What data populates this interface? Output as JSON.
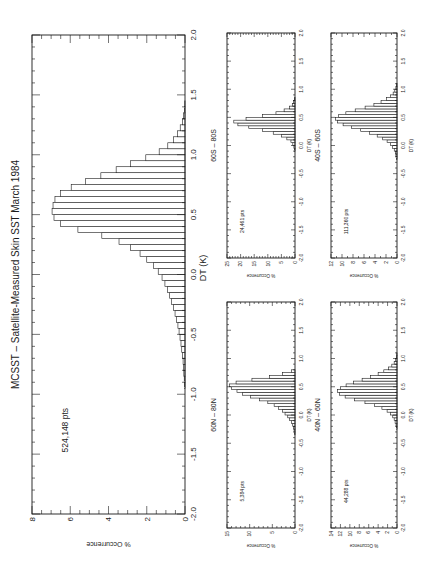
{
  "figure": {
    "title": "MCSST – Satellite-Measured Skin SST   March 1984",
    "orientation": "rotated 90 degrees clockwise"
  },
  "chart_data": [
    {
      "id": "main",
      "type": "bar",
      "title": "MCSST – Satellite-Measured Skin SST   March 1984",
      "annotation": "524,148 pts",
      "xlabel": "DT (K)",
      "ylabel": "% Occurrence",
      "xlim": [
        -2.0,
        2.0
      ],
      "ylim": [
        0,
        8
      ],
      "xticks": [
        "-2.0",
        "-1.5",
        "-1.0",
        "-0.5",
        "0.0",
        "0.5",
        "1.0",
        "1.5",
        "2.0"
      ],
      "yticks": [
        "0",
        "2",
        "4",
        "6",
        "8"
      ],
      "bin_width": 0.05,
      "x": [
        -0.95,
        -0.9,
        -0.85,
        -0.8,
        -0.75,
        -0.7,
        -0.65,
        -0.6,
        -0.55,
        -0.5,
        -0.45,
        -0.4,
        -0.35,
        -0.3,
        -0.25,
        -0.2,
        -0.15,
        -0.1,
        -0.05,
        0.0,
        0.05,
        0.1,
        0.15,
        0.2,
        0.25,
        0.3,
        0.35,
        0.4,
        0.45,
        0.5,
        0.55,
        0.6,
        0.65,
        0.7,
        0.75,
        0.8,
        0.85,
        0.9,
        0.95,
        1.0,
        1.05,
        1.1,
        1.15,
        1.2,
        1.25,
        1.3,
        1.35,
        1.4
      ],
      "values": [
        0.02,
        0.04,
        0.06,
        0.08,
        0.1,
        0.13,
        0.17,
        0.21,
        0.26,
        0.31,
        0.37,
        0.44,
        0.52,
        0.6,
        0.7,
        0.8,
        0.92,
        1.05,
        1.2,
        1.4,
        1.65,
        2.0,
        2.35,
        2.85,
        3.45,
        4.35,
        5.6,
        6.5,
        6.85,
        6.95,
        6.9,
        6.8,
        6.5,
        5.95,
        5.2,
        4.4,
        3.6,
        2.85,
        2.05,
        1.35,
        0.9,
        0.6,
        0.4,
        0.25,
        0.14,
        0.07,
        0.03,
        0.01
      ]
    },
    {
      "id": "60S-80S",
      "type": "bar",
      "title": "60S – 80S",
      "annotation": "24,461 pts",
      "xlabel": "DT (K)",
      "ylabel": "% Occurrence",
      "xlim": [
        -2.0,
        2.0
      ],
      "ylim": [
        0,
        25
      ],
      "xticks": [
        "-2.0",
        "-1.5",
        "-1.0",
        "-0.5",
        "0.0",
        "0.5",
        "1.0",
        "1.5",
        "2.0"
      ],
      "yticks": [
        "0",
        "5",
        "10",
        "15",
        "20",
        "25"
      ],
      "bin_width": 0.05,
      "x": [
        -0.1,
        -0.05,
        0.0,
        0.05,
        0.1,
        0.15,
        0.2,
        0.25,
        0.3,
        0.35,
        0.4,
        0.45,
        0.5,
        0.55,
        0.6,
        0.65,
        0.7,
        0.75,
        0.8
      ],
      "values": [
        0.2,
        0.4,
        0.8,
        1.5,
        3.0,
        5.0,
        8.0,
        12.0,
        17.0,
        21.0,
        22.5,
        18.0,
        12.0,
        7.0,
        4.0,
        2.0,
        1.0,
        0.5,
        0.2
      ]
    },
    {
      "id": "40S-60S",
      "type": "bar",
      "title": "40S – 60S",
      "annotation": "111,360 pts",
      "xlabel": "DT (K)",
      "ylabel": "% Occurrence",
      "xlim": [
        -2.0,
        2.0
      ],
      "ylim": [
        0,
        12
      ],
      "xticks": [
        "-2.0",
        "-1.5",
        "-1.0",
        "-0.5",
        "0.0",
        "0.5",
        "1.0",
        "1.5",
        "2.0"
      ],
      "yticks": [
        "0",
        "2",
        "4",
        "6",
        "8",
        "10",
        "12"
      ],
      "bin_width": 0.05,
      "x": [
        -0.25,
        -0.2,
        -0.15,
        -0.1,
        -0.05,
        0.0,
        0.05,
        0.1,
        0.15,
        0.2,
        0.25,
        0.3,
        0.35,
        0.4,
        0.45,
        0.5,
        0.55,
        0.6,
        0.65,
        0.7,
        0.75,
        0.8,
        0.85,
        0.9,
        0.95,
        1.0,
        1.05
      ],
      "values": [
        0.1,
        0.2,
        0.3,
        0.5,
        0.8,
        1.2,
        1.8,
        2.6,
        3.6,
        5.0,
        6.6,
        8.3,
        9.8,
        10.8,
        11.2,
        10.6,
        9.3,
        7.6,
        5.8,
        4.2,
        2.9,
        1.9,
        1.2,
        0.7,
        0.4,
        0.2,
        0.1
      ]
    },
    {
      "id": "60N-80N",
      "type": "bar",
      "title": "60N – 80N",
      "annotation": "5,384 pts",
      "xlabel": "DT (K)",
      "ylabel": "% Occurrence",
      "xlim": [
        -2.0,
        2.0
      ],
      "ylim": [
        0,
        15
      ],
      "xticks": [
        "-2.0",
        "-1.5",
        "-1.0",
        "-0.5",
        "0.0",
        "0.5",
        "1.0",
        "1.5",
        "2.0"
      ],
      "yticks": [
        "0",
        "5",
        "10",
        "15"
      ],
      "bin_width": 0.05,
      "x": [
        -0.35,
        -0.3,
        -0.25,
        -0.2,
        -0.15,
        -0.1,
        -0.05,
        0.0,
        0.05,
        0.1,
        0.15,
        0.2,
        0.25,
        0.3,
        0.35,
        0.4,
        0.45,
        0.5,
        0.55,
        0.6,
        0.65,
        0.7,
        0.75
      ],
      "values": [
        0.1,
        0.2,
        0.3,
        0.5,
        0.8,
        1.2,
        1.6,
        2.2,
        2.8,
        3.6,
        4.6,
        6.0,
        7.8,
        9.8,
        11.6,
        12.8,
        14.0,
        14.5,
        13.0,
        9.5,
        5.6,
        2.8,
        0.8
      ]
    },
    {
      "id": "40N-60N",
      "type": "bar",
      "title": "40N – 60N",
      "annotation": "44,288 pts",
      "xlabel": "DT (K)",
      "ylabel": "% Occurrence",
      "xlim": [
        -2.0,
        2.0
      ],
      "ylim": [
        0,
        14
      ],
      "xticks": [
        "-2.0",
        "-1.5",
        "-1.0",
        "-0.5",
        "0.0",
        "0.5",
        "1.0",
        "1.5",
        "2.0"
      ],
      "yticks": [
        "0",
        "2",
        "4",
        "6",
        "8",
        "10",
        "12",
        "14"
      ],
      "bin_width": 0.05,
      "x": [
        -0.25,
        -0.2,
        -0.15,
        -0.1,
        -0.05,
        0.0,
        0.05,
        0.1,
        0.15,
        0.2,
        0.25,
        0.3,
        0.35,
        0.4,
        0.45,
        0.5,
        0.55,
        0.6,
        0.65,
        0.7,
        0.75,
        0.8,
        0.85,
        0.9,
        0.95,
        1.0,
        1.05
      ],
      "values": [
        0.1,
        0.2,
        0.4,
        0.6,
        0.9,
        1.4,
        2.1,
        3.2,
        4.8,
        6.8,
        9.0,
        11.0,
        12.2,
        12.6,
        12.0,
        10.8,
        9.2,
        7.4,
        5.6,
        4.0,
        2.8,
        1.8,
        1.1,
        0.6,
        0.3,
        0.15,
        0.05
      ]
    }
  ],
  "layout": {
    "panels": [
      {
        "id": "main",
        "left": 32,
        "top": 35,
        "right": 185,
        "bottom": 514,
        "title_x": 15,
        "title_font": 10,
        "tick_font": 8,
        "label_font": 7,
        "minor": 0.1,
        "annot_x": 68,
        "annot_dt": -1.3
      },
      {
        "id": "60S-80S",
        "left": 227,
        "top": 33,
        "right": 295,
        "bottom": 258,
        "title_x": 213,
        "title_font": 7,
        "tick_font": 5,
        "label_font": 4.5,
        "minor": 0.1,
        "annot_x": 244,
        "annot_dt": -1.35
      },
      {
        "id": "40S-60S",
        "left": 331,
        "top": 33,
        "right": 397,
        "bottom": 258,
        "title_x": 317,
        "title_font": 7,
        "tick_font": 5,
        "label_font": 4.5,
        "minor": 0.1,
        "annot_x": 348,
        "annot_dt": -1.35
      },
      {
        "id": "60N-80N",
        "left": 227,
        "top": 302,
        "right": 295,
        "bottom": 528,
        "title_x": 213,
        "title_font": 7,
        "tick_font": 5,
        "label_font": 4.5,
        "minor": 0.1,
        "annot_x": 244,
        "annot_dt": -1.35
      },
      {
        "id": "40N-60N",
        "left": 331,
        "top": 302,
        "right": 397,
        "bottom": 528,
        "title_x": 317,
        "title_font": 7,
        "tick_font": 5,
        "label_font": 4.5,
        "minor": 0.1,
        "annot_x": 348,
        "annot_dt": -1.35
      }
    ],
    "colors": {
      "ink": "#1a1a1a",
      "bar_fill": "#ffffff",
      "background": "#ffffff"
    }
  }
}
